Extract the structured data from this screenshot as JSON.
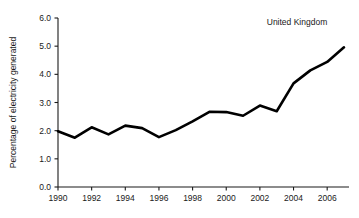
{
  "chart_data": {
    "type": "line",
    "title": "",
    "annotation": "United Kingdom",
    "xlabel": "",
    "ylabel": "Percentage of electricity generated",
    "xlim": [
      1990,
      2007
    ],
    "ylim": [
      0.0,
      6.0
    ],
    "grid": false,
    "legend_position": "none",
    "line_color": "#000000",
    "x_tick_labels": [
      "1990",
      "1992",
      "1994",
      "1996",
      "1998",
      "2000",
      "2002",
      "2004",
      "2006"
    ],
    "x_tick_values": [
      1990,
      1992,
      1994,
      1996,
      1998,
      2000,
      2002,
      2004,
      2006
    ],
    "y_tick_labels": [
      "0.0",
      "1.0",
      "2.0",
      "3.0",
      "4.0",
      "5.0",
      "6.0"
    ],
    "y_tick_values": [
      0.0,
      1.0,
      2.0,
      3.0,
      4.0,
      5.0,
      6.0
    ],
    "x": [
      1990,
      1991,
      1992,
      1993,
      1994,
      1995,
      1996,
      1997,
      1998,
      1999,
      2000,
      2001,
      2002,
      2003,
      2004,
      2005,
      2006,
      2007
    ],
    "series": [
      {
        "name": "United Kingdom",
        "values": [
          1.98,
          1.75,
          2.12,
          1.87,
          2.18,
          2.09,
          1.77,
          2.02,
          2.33,
          2.67,
          2.66,
          2.53,
          2.89,
          2.69,
          3.68,
          4.14,
          4.44,
          4.96
        ]
      }
    ]
  }
}
